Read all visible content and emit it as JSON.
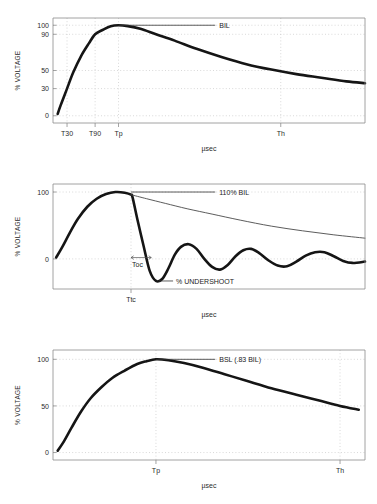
{
  "figure": {
    "background_color": "#ffffff",
    "curve_color": "#151515",
    "grid_color": "#c8c8c8",
    "axis_color": "#8c8c8c"
  },
  "chart_data": [
    {
      "type": "line",
      "id": "full-wave-bil",
      "title": "",
      "xlabel": "µsec",
      "ylabel": "% VOLTAGE",
      "ylim": [
        -8,
        108
      ],
      "xlim": [
        0,
        100
      ],
      "grid": true,
      "legend": "none",
      "yticks": [
        0,
        30,
        50,
        90,
        100
      ],
      "ytick_labels": [
        "0",
        "30",
        "50",
        "90",
        "100"
      ],
      "xticks": [
        4.5,
        13.5,
        21.0,
        73.0
      ],
      "xtick_labels": [
        "T30",
        "T90",
        "Tp",
        "Th"
      ],
      "annotations": [
        {
          "label": "BIL",
          "x": 21.0,
          "y": 100
        }
      ],
      "series": [
        {
          "name": "full wave",
          "x": [
            1.5,
            2.5,
            4.5,
            6.5,
            9.0,
            11.5,
            13.5,
            16.0,
            18.5,
            21.0,
            24.0,
            28.0,
            33.0,
            39.0,
            46.0,
            54.0,
            62.0,
            70.0,
            78.0,
            86.0,
            94.0,
            100.0
          ],
          "values": [
            2,
            12,
            30,
            48,
            66,
            80,
            90,
            95,
            99,
            100,
            99,
            96,
            90,
            83,
            74,
            65,
            57,
            51,
            46,
            42,
            38,
            36
          ]
        }
      ]
    },
    {
      "type": "line",
      "id": "chopped-wave",
      "title": "",
      "xlabel": "µsec",
      "ylabel": "% VOLTAGE",
      "ylim": [
        -45,
        112
      ],
      "xlim": [
        0,
        100
      ],
      "grid": true,
      "legend": "none",
      "yticks": [
        0,
        100
      ],
      "ytick_labels": [
        "0",
        "100"
      ],
      "xticks": [
        25.0
      ],
      "xtick_labels": [
        "Ttc"
      ],
      "annotations": [
        {
          "label": "110% BIL",
          "x": 25.0,
          "y": 100
        },
        {
          "label": "% UNDERSHOOT",
          "x": 34.0,
          "y": -33
        },
        {
          "label": "Toc",
          "x": 29.0,
          "y": -10
        }
      ],
      "series": [
        {
          "name": "chopped wave",
          "x": [
            1.0,
            3.0,
            5.5,
            8.0,
            11.0,
            14.0,
            17.0,
            20.0,
            23.0,
            25.0,
            25.5,
            27.0,
            29.0,
            31.0,
            33.0,
            35.0,
            37.0,
            39.0,
            41.0,
            43.5,
            46.0,
            48.5,
            51.0,
            53.5,
            56.0,
            58.5,
            61.0,
            63.5,
            66.0,
            69.0,
            72.0,
            75.0,
            78.0,
            81.0,
            84.0,
            87.0,
            90.0,
            93.0,
            96.0,
            100.0
          ],
          "values": [
            2,
            18,
            40,
            60,
            78,
            90,
            97,
            100,
            99,
            96,
            92,
            60,
            20,
            -18,
            -33,
            -30,
            -14,
            6,
            18,
            22,
            15,
            0,
            -12,
            -16,
            -9,
            4,
            13,
            15,
            9,
            -2,
            -10,
            -11,
            -4,
            5,
            10,
            10,
            4,
            -3,
            -6,
            -4
          ]
        },
        {
          "name": "full wave reference",
          "x": [
            25.0,
            30.0,
            36.0,
            43.0,
            51.0,
            60.0,
            70.0,
            80.0,
            90.0,
            100.0
          ],
          "values": [
            96,
            90,
            83,
            75,
            67,
            58,
            49,
            42,
            36,
            31
          ]
        }
      ]
    },
    {
      "type": "line",
      "id": "switching-surge-bsl",
      "title": "",
      "xlabel": "µsec",
      "ylabel": "% VOLTAGE",
      "ylim": [
        -8,
        110
      ],
      "xlim": [
        0,
        100
      ],
      "grid": true,
      "legend": "none",
      "yticks": [
        0,
        50,
        100
      ],
      "ytick_labels": [
        "0",
        "50",
        "100"
      ],
      "xticks": [
        33.0,
        92.0
      ],
      "xtick_labels": [
        "Tp",
        "Th"
      ],
      "annotations": [
        {
          "label": "BSL (.83 BIL)",
          "x": 33.0,
          "y": 100
        }
      ],
      "series": [
        {
          "name": "switching surge",
          "x": [
            1.5,
            3.5,
            6.0,
            9.0,
            12.0,
            15.5,
            19.0,
            23.0,
            27.0,
            30.0,
            33.0,
            37.0,
            42.0,
            48.0,
            55.0,
            62.0,
            70.0,
            78.0,
            85.0,
            92.0,
            98.0
          ],
          "values": [
            2,
            12,
            27,
            44,
            58,
            70,
            80,
            88,
            95,
            98,
            100,
            99,
            96,
            91,
            84,
            77,
            69,
            62,
            56,
            50,
            46
          ]
        }
      ]
    }
  ]
}
